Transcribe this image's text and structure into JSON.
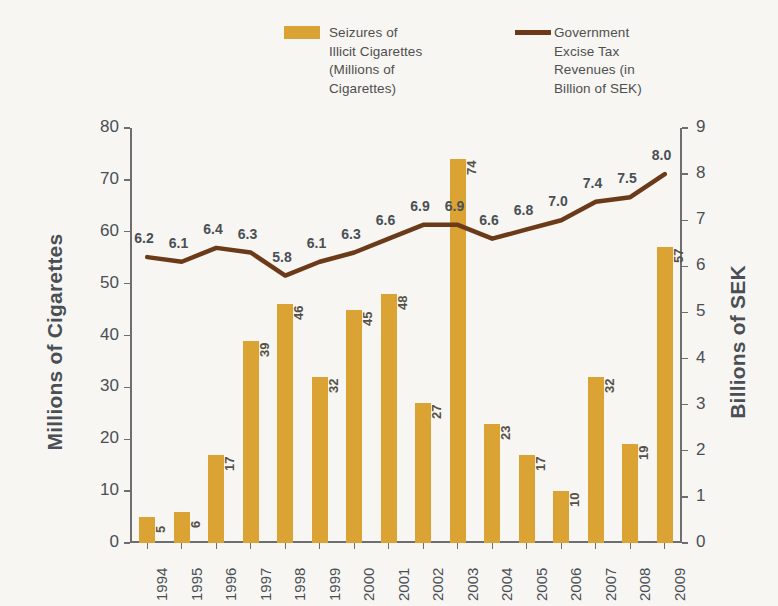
{
  "legend": {
    "bar": {
      "label": "Seizures of\nIllicit Cigarettes\n(Millions of\nCigarettes)",
      "color": "#dba334"
    },
    "line": {
      "label": "Government\nExcise Tax\nRevenues  (in\nBillion of SEK)",
      "color": "#6b3a18"
    }
  },
  "axes": {
    "left_title": "Millions of Cigarettes",
    "right_title": "Billions of SEK"
  },
  "chart_data": {
    "type": "bar",
    "title": "",
    "subtitle": "",
    "xlabel": "",
    "ylabel": "Millions of Cigarettes",
    "y2label": "Billions of SEK",
    "categories": [
      "1994",
      "1995",
      "1996",
      "1997",
      "1998",
      "1999",
      "2000",
      "2001",
      "2002",
      "2003",
      "2004",
      "2005",
      "2006",
      "2007",
      "2008",
      "2009"
    ],
    "ylim": [
      0,
      80
    ],
    "yticks": [
      0,
      10,
      20,
      30,
      40,
      50,
      60,
      70,
      80
    ],
    "y2lim": [
      0,
      9
    ],
    "y2ticks": [
      0,
      1,
      2,
      3,
      4,
      5,
      6,
      7,
      8,
      9
    ],
    "grid": false,
    "legend_position": "top",
    "series": [
      {
        "name": "Seizures of Illicit Cigarettes (Millions of Cigarettes)",
        "type": "bar",
        "axis": "left",
        "color": "#dba334",
        "values": [
          5,
          6,
          17,
          39,
          46,
          32,
          45,
          48,
          27,
          74,
          23,
          17,
          10,
          32,
          19,
          57
        ],
        "labels": [
          "5",
          "6",
          "17",
          "39",
          "46",
          "32",
          "45",
          "48",
          "27",
          "74",
          "23",
          "17",
          "10",
          "32",
          "19",
          "57"
        ]
      },
      {
        "name": "Government Excise Tax Revenues (in Billion of SEK)",
        "type": "line",
        "axis": "right",
        "color": "#6b3a18",
        "values": [
          6.2,
          6.1,
          6.4,
          6.3,
          5.8,
          6.1,
          6.3,
          6.6,
          6.9,
          6.9,
          6.6,
          6.8,
          7.0,
          7.4,
          7.5,
          8.0
        ],
        "labels": [
          "6.2",
          "6.1",
          "6.4",
          "6.3",
          "5.8",
          "6.1",
          "6.3",
          "6.6",
          "6.9",
          "6.9",
          "6.6",
          "6.8",
          "7.0",
          "7.4",
          "7.5",
          "8.0"
        ]
      }
    ]
  }
}
